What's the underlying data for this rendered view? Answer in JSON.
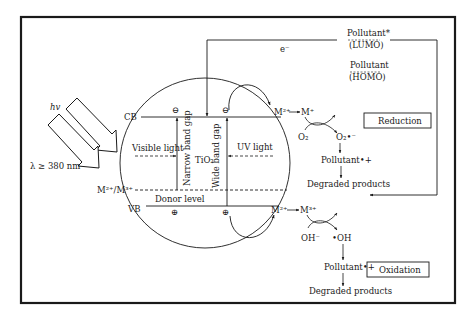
{
  "diagram": {
    "type": "photocatalysis-mechanism",
    "colors": {
      "stroke": "#1a1a1a",
      "background": "#ffffff"
    },
    "light": {
      "hv": "hv",
      "wavelength": "λ ≥ 380 nm",
      "visible": "Visible light",
      "uv": "UV light"
    },
    "bands": {
      "cb": "CB",
      "vb": "VB",
      "dopant_level": "M²⁺/M³⁺",
      "donor_level": "Donor level",
      "narrow_gap": "Narrow band gap",
      "wide_gap": "Wide band gap",
      "material": "TiO₂",
      "electron": "⊖",
      "hole": "⊕"
    },
    "electron_label": "e⁻",
    "pollutant_levels": {
      "excited": "Pollutant*",
      "lumo": "(LUMO)",
      "ground": "Pollutant",
      "homo": "(HOMO)"
    },
    "reduction": {
      "m_start": "M²⁺",
      "m_end": "M⁺",
      "o2": "O₂",
      "superoxide": "O₂•⁻",
      "radical_pollutant": "Pollutant•+",
      "products": "Degraded products",
      "box_label": "Reduction"
    },
    "oxidation": {
      "m_start": "M²⁺",
      "m_end": "M³⁺",
      "hydroxide": "OH⁻",
      "hydroxyl": "•OH",
      "radical_pollutant": "Pollutant•+",
      "products": "Degraded products",
      "box_label": "Oxidation"
    }
  }
}
